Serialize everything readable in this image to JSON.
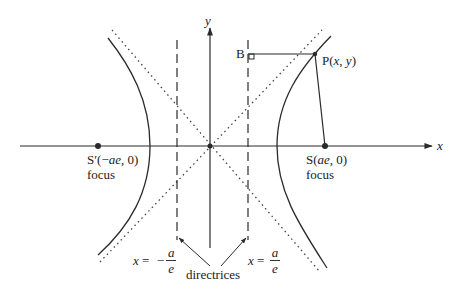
{
  "diagram": {
    "axes": {
      "x_label": "x",
      "y_label": "y"
    },
    "point_p": {
      "label_prefix": "P(",
      "label_x": "x",
      "label_sep": ", ",
      "label_y": "y",
      "label_suffix": ")"
    },
    "point_b": {
      "label": "B"
    },
    "focus_left": {
      "coord_prefix": "S′(−",
      "coord_var": "ae",
      "coord_suffix": ", 0)",
      "caption": "focus"
    },
    "focus_right": {
      "coord_prefix": "S(",
      "coord_var": "ae",
      "coord_suffix": ", 0)",
      "caption": "focus"
    },
    "directrix_left": {
      "lhs": "x",
      "eq": " = ",
      "sign": "−",
      "num": "a",
      "den": "e"
    },
    "directrix_right": {
      "lhs": "x",
      "eq": " = ",
      "num": "a",
      "den": "e"
    },
    "directrices_caption": "directrices",
    "colors": {
      "stroke": "#2a2a2a",
      "background": "#ffffff"
    }
  }
}
